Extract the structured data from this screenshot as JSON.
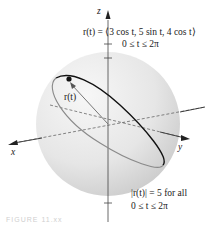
{
  "labels": {
    "z_axis": "z",
    "x_axis": "x",
    "y_axis": "y",
    "position_vector": "r(t)",
    "equation_line1": "r(t) = ⟨3 cos t, 5 sin t, 4 cos t⟩",
    "equation_line2": "0 ≤ t ≤ 2π",
    "magnitude_line1": "|r(t)| = 5 for all",
    "magnitude_line2": "0 ≤ t ≤ 2π",
    "caption": "FIGURE 11.xx"
  },
  "colors": {
    "sphere_light": "#f4f4f4",
    "sphere_dark": "#cfcfcf",
    "curve_front": "#111111",
    "curve_back": "#8a8a8a",
    "axis": "#444444"
  }
}
